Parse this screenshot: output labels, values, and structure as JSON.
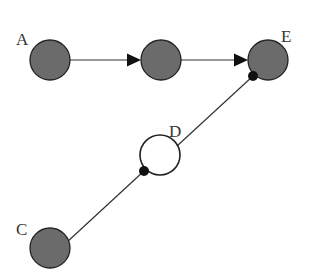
{
  "diagram": {
    "type": "graph",
    "nodes": [
      {
        "id": "A",
        "label": "A",
        "cx": 50,
        "cy": 60,
        "r": 20,
        "style": "filled",
        "label_x": 16,
        "label_y": 45
      },
      {
        "id": "B",
        "label": "",
        "cx": 161,
        "cy": 60,
        "r": 20,
        "style": "filled"
      },
      {
        "id": "E",
        "label": "E",
        "cx": 268,
        "cy": 60,
        "r": 20,
        "style": "filled",
        "label_x": 281,
        "label_y": 42
      },
      {
        "id": "D",
        "label": "D",
        "cx": 160,
        "cy": 155,
        "r": 20,
        "style": "hollow",
        "label_x": 169,
        "label_y": 137
      },
      {
        "id": "C",
        "label": "C",
        "cx": 50,
        "cy": 248,
        "r": 20,
        "style": "filled",
        "label_x": 16,
        "label_y": 235
      }
    ],
    "edges": [
      {
        "from": "A",
        "to": "B",
        "kind": "arrow"
      },
      {
        "from": "B",
        "to": "E",
        "kind": "arrow"
      },
      {
        "from": "C",
        "to": "D",
        "kind": "dot-terminated line"
      },
      {
        "from": "D",
        "to": "E",
        "kind": "dot-terminated line"
      }
    ],
    "colors": {
      "filled_node": "#6b6b6b",
      "stroke": "#222222",
      "background": "#ffffff"
    }
  }
}
